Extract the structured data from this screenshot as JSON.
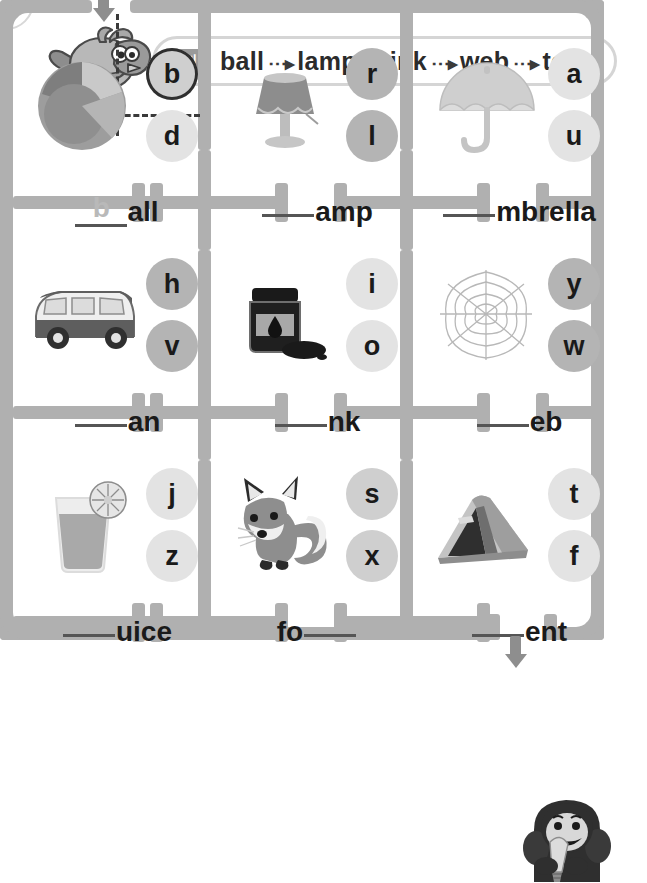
{
  "worksheet": {
    "example_label": "보기",
    "example_words": [
      "ball",
      "lamp",
      "ink",
      "web",
      "tent"
    ],
    "arrow_glyph": "⋯▸"
  },
  "mascots": {
    "start_bird": "bird-mascot",
    "end_gorilla": "gorilla-mascot"
  },
  "maze": {
    "entrance_arrow": "arrow-down-icon",
    "exit_arrow": "arrow-down-icon",
    "solution_letter": "b"
  },
  "cells": [
    {
      "id": "ball",
      "picture": "beach-ball",
      "choices": [
        {
          "letter": "b",
          "tone": "tone-mid",
          "marked": true
        },
        {
          "letter": "d",
          "tone": "tone-light",
          "marked": false
        }
      ],
      "prefix": "",
      "filled": "b",
      "blank_before": false,
      "suffix": "all"
    },
    {
      "id": "lamp",
      "picture": "table-lamp",
      "choices": [
        {
          "letter": "r",
          "tone": "tone-dark",
          "marked": false
        },
        {
          "letter": "l",
          "tone": "tone-dark",
          "marked": false
        }
      ],
      "prefix": "",
      "filled": "",
      "blank_before": true,
      "suffix": "amp"
    },
    {
      "id": "umbrella",
      "picture": "umbrella",
      "choices": [
        {
          "letter": "a",
          "tone": "tone-light",
          "marked": false
        },
        {
          "letter": "u",
          "tone": "tone-light",
          "marked": false
        }
      ],
      "prefix": "",
      "filled": "",
      "blank_before": true,
      "suffix": "mbrella"
    },
    {
      "id": "van",
      "picture": "van",
      "choices": [
        {
          "letter": "h",
          "tone": "tone-dark",
          "marked": false
        },
        {
          "letter": "v",
          "tone": "tone-dark",
          "marked": false
        }
      ],
      "prefix": "",
      "filled": "",
      "blank_before": true,
      "suffix": "an"
    },
    {
      "id": "ink",
      "picture": "ink-bottle",
      "choices": [
        {
          "letter": "i",
          "tone": "tone-light",
          "marked": false
        },
        {
          "letter": "o",
          "tone": "tone-light",
          "marked": false
        }
      ],
      "prefix": "",
      "filled": "",
      "blank_before": true,
      "suffix": "nk"
    },
    {
      "id": "web",
      "picture": "spider-web",
      "choices": [
        {
          "letter": "y",
          "tone": "tone-dark",
          "marked": false
        },
        {
          "letter": "w",
          "tone": "tone-dark",
          "marked": false
        }
      ],
      "prefix": "",
      "filled": "",
      "blank_before": true,
      "suffix": "eb"
    },
    {
      "id": "juice",
      "picture": "juice-glass",
      "choices": [
        {
          "letter": "j",
          "tone": "tone-light",
          "marked": false
        },
        {
          "letter": "z",
          "tone": "tone-light",
          "marked": false
        }
      ],
      "prefix": "",
      "filled": "",
      "blank_before": true,
      "suffix": "uice"
    },
    {
      "id": "fox",
      "picture": "fox",
      "choices": [
        {
          "letter": "s",
          "tone": "tone-mid",
          "marked": false
        },
        {
          "letter": "x",
          "tone": "tone-mid",
          "marked": false
        }
      ],
      "prefix": "fo",
      "filled": "",
      "blank_before": false,
      "blank_after": true,
      "suffix": ""
    },
    {
      "id": "tent",
      "picture": "tent",
      "choices": [
        {
          "letter": "t",
          "tone": "tone-light",
          "marked": false
        },
        {
          "letter": "f",
          "tone": "tone-light",
          "marked": false
        }
      ],
      "prefix": "",
      "filled": "",
      "blank_before": true,
      "suffix": "ent"
    }
  ]
}
